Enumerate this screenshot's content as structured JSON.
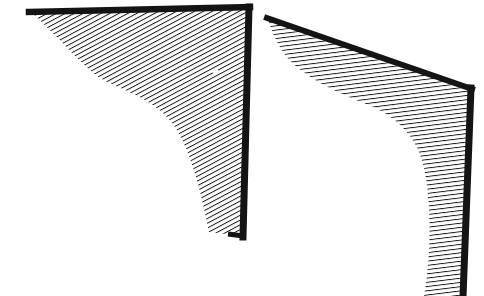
{
  "document": {
    "title": "Hatched Corner Fillet Diagram",
    "background_color": "#ffffff",
    "ink_color": "#111111",
    "width": 484,
    "height": 296,
    "description": "Two monochrome line-art figures showing hatched corner regions with thick solid borders and concave curved inner boundaries."
  },
  "figures": [
    {
      "id": "left-figure",
      "name": "left-hatched-corner",
      "border_color": "#141414",
      "hatch_color": "#141414",
      "hatch_angle_deg": 62,
      "hatch_spacing_px": 4.2,
      "hatch_line_width_px": 1.9,
      "top_edge": {
        "x1": 30,
        "y1": 11,
        "x2": 249,
        "y2": 7
      },
      "right_edge": {
        "x1": 249,
        "y1": 7,
        "x2": 243,
        "y2": 236
      },
      "bottom_tip": {
        "x": 209,
        "y": 232
      },
      "border_thickness_px": 7,
      "curve_label": "concave-fillet",
      "curve_points": "30,11 52,30 78,56 104,78 140,92 172,118 196,170 209,232"
    },
    {
      "id": "right-figure",
      "name": "right-hatched-corner",
      "border_color": "#141414",
      "hatch_color": "#141414",
      "hatch_angle_deg": 83,
      "hatch_spacing_px": 4.2,
      "hatch_line_width_px": 1.9,
      "top_edge": {
        "x1": 268,
        "y1": 19,
        "x2": 471,
        "y2": 88
      },
      "right_edge": {
        "x1": 471,
        "y1": 88,
        "x2": 463,
        "y2": 296
      },
      "bottom_tip": {
        "x": 424,
        "y": 296
      },
      "border_thickness_px": 7,
      "curve_label": "concave-fillet",
      "curve_points": "268,19 280,42 292,62 318,82 352,98 386,110 412,140 428,196 430,250 424,296"
    }
  ],
  "annotations": {
    "legend": "",
    "caption": "",
    "labels": []
  }
}
